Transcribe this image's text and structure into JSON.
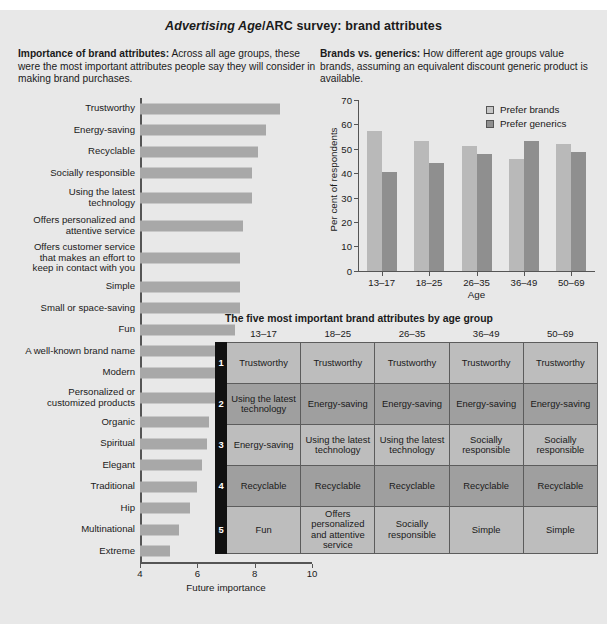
{
  "figure": {
    "title_italic": "Advertising Age",
    "title_rest": "/ARC survey: brand attributes"
  },
  "left": {
    "blurb_bold": "Importance of brand attributes:",
    "blurb_text": " Across all age groups, these were the most important attributes people say they will consider in making brand purchases."
  },
  "right": {
    "blurb_bold": "Brands vs. generics:",
    "blurb_text": " How different age groups value brands, assuming an equivalent discount generic product is available."
  },
  "table": {
    "title": "The five most important brand attributes by age group",
    "columns": [
      "13–17",
      "18–25",
      "26–35",
      "36–49",
      "50–69"
    ],
    "rows": [
      {
        "rank": "1",
        "cells": [
          "Trustworthy",
          "Trustworthy",
          "Trustworthy",
          "Trustworthy",
          "Trustworthy"
        ]
      },
      {
        "rank": "2",
        "cells": [
          "Using the latest technology",
          "Energy-saving",
          "Energy-saving",
          "Energy-saving",
          "Energy-saving"
        ]
      },
      {
        "rank": "3",
        "cells": [
          "Energy-saving",
          "Using the latest technology",
          "Using the latest technology",
          "Socially responsible",
          "Socially responsible"
        ]
      },
      {
        "rank": "4",
        "cells": [
          "Recyclable",
          "Recyclable",
          "Recyclable",
          "Recyclable",
          "Recyclable"
        ]
      },
      {
        "rank": "5",
        "cells": [
          "Fun",
          "Offers personalized and attentive service",
          "Socially responsible",
          "Simple",
          "Simple"
        ]
      }
    ]
  },
  "chart_data": [
    {
      "type": "bar",
      "orientation": "horizontal",
      "title": "Importance of brand attributes",
      "xlabel": "Future importance",
      "ylabel": "",
      "xlim": [
        4,
        10
      ],
      "xticks": [
        4,
        6,
        8,
        10
      ],
      "grid": false,
      "bar_color": "#a8a8a8",
      "categories": [
        "Trustworthy",
        "Energy-saving",
        "Recyclable",
        "Socially responsible",
        "Using the latest\ntechnology",
        "Offers personalized and\nattentive service",
        "Offers customer service\nthat makes an effort to\nkeep in contact with you",
        "Simple",
        "Small or space-saving",
        "Fun",
        "A well-known brand name",
        "Modern",
        "Personalized or\ncustomized products",
        "Organic",
        "Spiritual",
        "Elegant",
        "Traditional",
        "Hip",
        "Multinational",
        "Extreme"
      ],
      "values": [
        8.9,
        8.4,
        8.1,
        7.9,
        7.9,
        7.6,
        7.5,
        7.5,
        7.5,
        7.3,
        7.2,
        6.8,
        6.7,
        6.4,
        6.35,
        6.15,
        6.0,
        5.75,
        5.35,
        5.05
      ]
    },
    {
      "type": "bar",
      "orientation": "vertical",
      "title": "Brands vs. generics",
      "xlabel": "Age",
      "ylabel": "Per cent of respondents",
      "ylim": [
        0,
        70
      ],
      "yticks": [
        0,
        10,
        20,
        30,
        40,
        50,
        60,
        70
      ],
      "grid": false,
      "legend_position": "top-right",
      "categories": [
        "13–17",
        "18–25",
        "26–35",
        "36–49",
        "50–69"
      ],
      "series": [
        {
          "name": "Prefer brands",
          "color": "#b9b9b9",
          "values": [
            57.5,
            53,
            51,
            46,
            52
          ]
        },
        {
          "name": "Prefer generics",
          "color": "#8f8f8f",
          "values": [
            40.5,
            44,
            48,
            53,
            48.5
          ]
        }
      ]
    }
  ]
}
